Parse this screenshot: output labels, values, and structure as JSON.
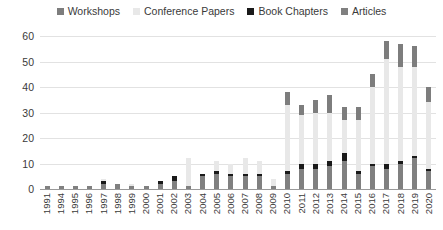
{
  "chart_data": {
    "type": "bar",
    "stacked": true,
    "title": "",
    "subtitle": "",
    "xlabel": "",
    "ylabel": "",
    "ylim": [
      0,
      60
    ],
    "ytick_step": 10,
    "yticks": [
      0,
      10,
      20,
      30,
      40,
      50,
      60
    ],
    "grid": true,
    "legend_position": "top-center",
    "categories": [
      "1991",
      "1994",
      "1995",
      "1996",
      "1997",
      "1998",
      "1999",
      "2000",
      "2001",
      "2002",
      "2003",
      "2004",
      "2005",
      "2006",
      "2007",
      "2008",
      "2009",
      "2010",
      "2011",
      "2012",
      "2013",
      "2014",
      "2015",
      "2016",
      "2017",
      "2018",
      "2019",
      "2020"
    ],
    "series": [
      {
        "name": "Articles",
        "color": "#808080",
        "values": [
          1,
          1,
          1,
          1,
          2,
          2,
          1,
          1,
          2,
          3,
          1,
          5,
          6,
          5,
          5,
          5,
          1,
          6,
          8,
          8,
          9,
          11,
          6,
          9,
          8,
          10,
          12,
          7
        ]
      },
      {
        "name": "Book Chapters",
        "color": "#1a1a1a",
        "values": [
          0,
          0,
          0,
          0,
          1,
          0,
          0,
          0,
          1,
          2,
          0,
          1,
          1,
          1,
          1,
          1,
          0,
          1,
          2,
          2,
          2,
          3,
          1,
          1,
          2,
          1,
          1,
          1
        ]
      },
      {
        "name": "Conference Papers",
        "color": "#e8e8e8",
        "values": [
          0,
          0,
          0,
          0,
          1,
          0,
          1,
          0,
          0,
          0,
          11,
          0,
          4,
          4,
          6,
          5,
          3,
          26,
          19,
          20,
          19,
          13,
          20,
          30,
          41,
          37,
          35,
          26
        ]
      },
      {
        "name": "Workshops",
        "color": "#7d7d7d",
        "values": [
          0,
          0,
          0,
          0,
          0,
          0,
          0,
          0,
          0,
          0,
          0,
          0,
          0,
          0,
          0,
          0,
          0,
          5,
          4,
          5,
          7,
          5,
          5,
          5,
          7,
          9,
          8,
          6
        ]
      }
    ],
    "stack_order_bottom_to_top": [
      "Articles",
      "Book Chapters",
      "Conference Papers",
      "Workshops"
    ],
    "totals": [
      1,
      1,
      1,
      1,
      4,
      2,
      2,
      1,
      3,
      5,
      12,
      6,
      11,
      10,
      12,
      11,
      4,
      38,
      33,
      35,
      37,
      32,
      32,
      45,
      58,
      57,
      56,
      40
    ]
  },
  "legend": {
    "items": [
      {
        "label": "Workshops",
        "color": "#7d7d7d"
      },
      {
        "label": "Conference Papers",
        "color": "#e8e8e8"
      },
      {
        "label": "Book Chapters",
        "color": "#1a1a1a"
      },
      {
        "label": "Articles",
        "color": "#808080"
      }
    ]
  },
  "axis": {
    "y_labels": [
      "60",
      "50",
      "40",
      "30",
      "20",
      "10",
      "0"
    ]
  },
  "colors": {
    "gridline": "#e2e2e2",
    "axis": "#9a9a9a",
    "text": "#3a3a3a",
    "background": "#ffffff"
  }
}
